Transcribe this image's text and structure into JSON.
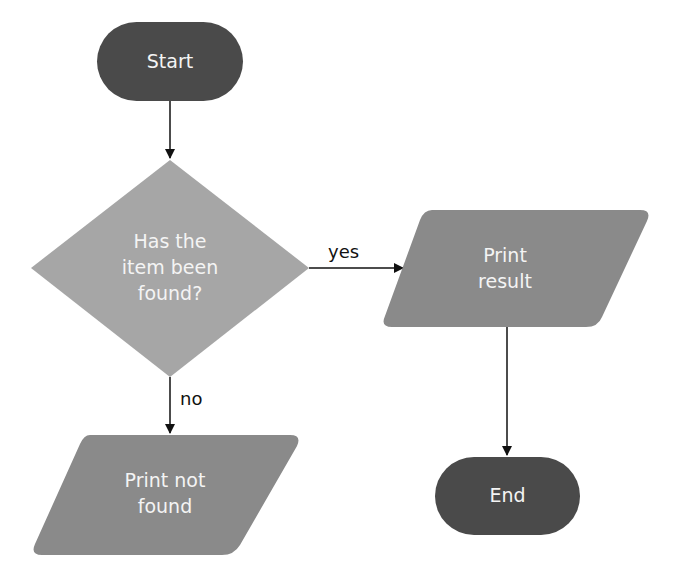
{
  "diagram": {
    "type": "flowchart",
    "nodes": [
      {
        "id": "start",
        "shape": "terminator",
        "label": "Start",
        "color": "#4a4a4a"
      },
      {
        "id": "decision",
        "shape": "diamond",
        "label_lines": [
          "Has the",
          "item been",
          "found?"
        ],
        "color": "#a6a6a6"
      },
      {
        "id": "print_result",
        "shape": "parallelogram",
        "label_lines": [
          "Print",
          "result"
        ],
        "color": "#8a8a8a"
      },
      {
        "id": "print_not_found",
        "shape": "parallelogram",
        "label_lines": [
          "Print not",
          "found"
        ],
        "color": "#8a8a8a"
      },
      {
        "id": "end",
        "shape": "terminator",
        "label": "End",
        "color": "#4a4a4a"
      }
    ],
    "edges": [
      {
        "from": "start",
        "to": "decision",
        "label": ""
      },
      {
        "from": "decision",
        "to": "print_result",
        "label": "yes"
      },
      {
        "from": "decision",
        "to": "print_not_found",
        "label": "no"
      },
      {
        "from": "print_result",
        "to": "end",
        "label": ""
      }
    ]
  },
  "nodes": {
    "start": "Start",
    "decision": {
      "line1": "Has the",
      "line2": "item been",
      "line3": "found?"
    },
    "print_result": {
      "line1": "Print",
      "line2": "result"
    },
    "print_not_found": {
      "line1": "Print not",
      "line2": "found"
    },
    "end": "End"
  },
  "edges": {
    "yes": "yes",
    "no": "no"
  },
  "colors": {
    "terminator": "#4a4a4a",
    "decision": "#a6a6a6",
    "io": "#8a8a8a",
    "arrow": "#111111",
    "text": "#f4f4f4"
  }
}
